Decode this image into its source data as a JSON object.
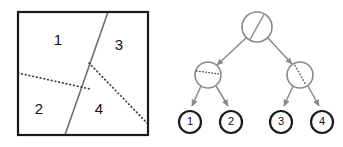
{
  "figure": {
    "title": "",
    "panels": [
      {
        "name": "partition-panel",
        "description": "square region partitioned into four numbered regions",
        "box": {
          "x": 18,
          "y": 12,
          "width": 130,
          "height": 123,
          "stroke": "#1a1a1a",
          "stroke_width": 2.2
        },
        "splits": [
          {
            "name": "root-split",
            "style": "solid",
            "color": "#6e6e6e",
            "stroke_width": 1.6,
            "x1": 108,
            "y1": 12,
            "x2": 65,
            "y2": 135
          },
          {
            "name": "left-split",
            "style": "dotted",
            "color": "#3c3c3c",
            "stroke_width": 1.7,
            "x1": 18,
            "y1": 73,
            "x2": 90,
            "y2": 89
          },
          {
            "name": "right-split",
            "style": "dotted",
            "color": "#3c3c3c",
            "stroke_width": 1.7,
            "x1": 89,
            "y1": 63,
            "x2": 148,
            "y2": 124
          }
        ],
        "regions": [
          {
            "id": "region-1",
            "label": "1",
            "x": 58,
            "y": 41
          },
          {
            "id": "region-2",
            "label": "2",
            "x": 39,
            "y": 110
          },
          {
            "id": "region-3",
            "label": "3",
            "x": 119,
            "y": 46
          },
          {
            "id": "region-4",
            "label": "4",
            "x": 99,
            "y": 110
          }
        ]
      },
      {
        "name": "tree-panel",
        "description": "binary decision tree matching the partition",
        "node_color": "#8a8a8a",
        "node_stroke_width": 1.6,
        "leaf_color": "#1a1a1a",
        "leaf_stroke_width": 2.2,
        "edge_color": "#8a8a8a",
        "edge_stroke_width": 1.5,
        "nodes": [
          {
            "id": "root",
            "kind": "internal",
            "glyph": "solid-diagonal-split",
            "cx": 257,
            "cy": 27,
            "r": 15
          },
          {
            "id": "internal-left",
            "kind": "internal",
            "glyph": "dotted-horizontal-split",
            "cx": 208,
            "cy": 75,
            "r": 13
          },
          {
            "id": "internal-right",
            "kind": "internal",
            "glyph": "dotted-diagonal-split",
            "cx": 300,
            "cy": 75,
            "r": 13
          },
          {
            "id": "leaf-1",
            "kind": "leaf",
            "label": "1",
            "cx": 190,
            "cy": 122,
            "r": 11
          },
          {
            "id": "leaf-2",
            "kind": "leaf",
            "label": "2",
            "cx": 231,
            "cy": 122,
            "r": 11
          },
          {
            "id": "leaf-3",
            "kind": "leaf",
            "label": "3",
            "cx": 281,
            "cy": 122,
            "r": 11
          },
          {
            "id": "leaf-4",
            "kind": "leaf",
            "label": "4",
            "cx": 322,
            "cy": 122,
            "r": 11
          }
        ],
        "edges": [
          {
            "id": "edge-root-left",
            "from": "root",
            "to": "internal-left",
            "arrow": true
          },
          {
            "id": "edge-root-right",
            "from": "root",
            "to": "internal-right",
            "arrow": true
          },
          {
            "id": "edge-left-leaf1",
            "from": "internal-left",
            "to": "leaf-1",
            "arrow": true
          },
          {
            "id": "edge-left-leaf2",
            "from": "internal-left",
            "to": "leaf-2",
            "arrow": true
          },
          {
            "id": "edge-right-leaf3",
            "from": "internal-right",
            "to": "leaf-3",
            "arrow": true
          },
          {
            "id": "edge-right-leaf4",
            "from": "internal-right",
            "to": "leaf-4",
            "arrow": true
          }
        ]
      }
    ]
  }
}
